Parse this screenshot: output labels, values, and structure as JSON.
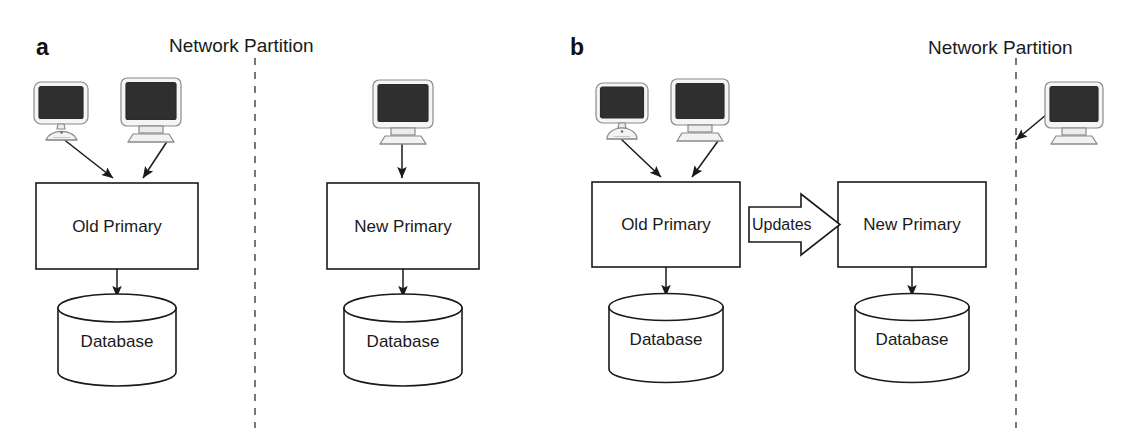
{
  "figure": {
    "background_color": "#ffffff",
    "stroke_color": "#1a1a1a",
    "screen_color": "#2b2b2b",
    "chassis_color": "#f2f2f2"
  },
  "panels": [
    {
      "letter": "a",
      "partition_label": "Network Partition",
      "left_group": {
        "clients": [
          {
            "icon": "imac-computer-icon",
            "style": "dome"
          },
          {
            "icon": "crt-computer-icon",
            "style": "crt"
          }
        ],
        "server_label": "Old Primary",
        "database_label": "Database"
      },
      "right_group": {
        "clients": [
          {
            "icon": "crt-computer-icon",
            "style": "crt"
          }
        ],
        "server_label": "New Primary",
        "database_label": "Database"
      }
    },
    {
      "letter": "b",
      "partition_label": "Network Partition",
      "left_group": {
        "clients": [
          {
            "icon": "imac-computer-icon",
            "style": "dome"
          },
          {
            "icon": "crt-computer-icon",
            "style": "crt"
          }
        ],
        "server_label": "Old Primary",
        "database_label": "Database"
      },
      "right_group": {
        "server_label": "New Primary",
        "database_label": "Database"
      },
      "replication_arrow_label": "Updates",
      "isolated_client": {
        "icon": "crt-computer-icon",
        "style": "crt"
      }
    }
  ]
}
